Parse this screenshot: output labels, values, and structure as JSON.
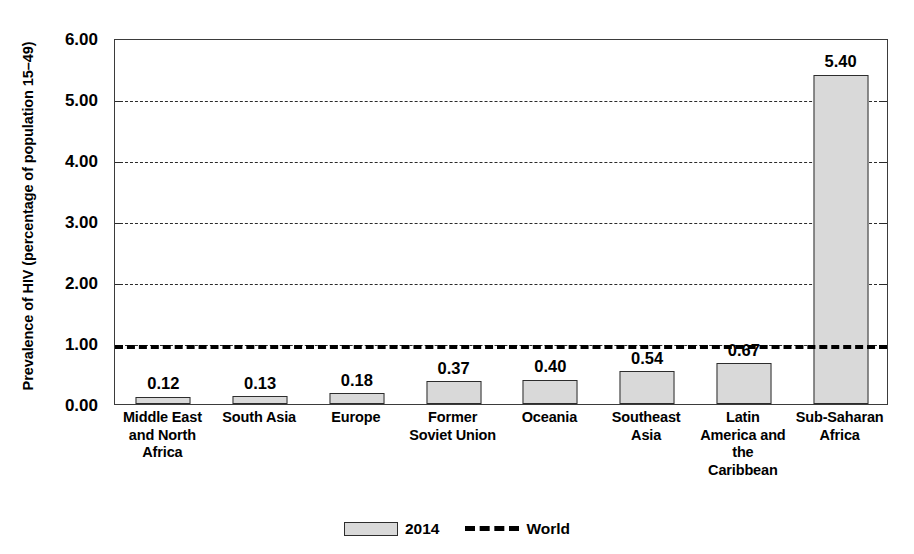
{
  "chart_data": {
    "type": "bar",
    "title": "",
    "subtitle": "",
    "xlabel": "",
    "ylabel": "Prevalence of HIV (percentage of population 15–49)",
    "ylim": [
      0,
      6
    ],
    "ytick_labels": [
      "0.00",
      "1.00",
      "2.00",
      "3.00",
      "4.00",
      "5.00",
      "6.00"
    ],
    "ytick_values": [
      0,
      1,
      2,
      3,
      4,
      5,
      6
    ],
    "grid": true,
    "grid_axis": "y",
    "grid_style": "dashed",
    "legend_position": "bottom-center",
    "categories": [
      "Middle East and North Africa",
      "South Asia",
      "Europe",
      "Former Soviet Union",
      "Oceania",
      "Southeast Asia",
      "Latin America and the Caribbean",
      "Sub-Saharan Africa"
    ],
    "category_label_lines": [
      [
        "Middle East",
        "and North",
        "Africa"
      ],
      [
        "South Asia"
      ],
      [
        "Europe"
      ],
      [
        "Former",
        "Soviet Union"
      ],
      [
        "Oceania"
      ],
      [
        "Southeast",
        "Asia"
      ],
      [
        "Latin",
        "America and",
        "the",
        "Caribbean"
      ],
      [
        "Sub-Saharan",
        "Africa"
      ]
    ],
    "series": [
      {
        "name": "2014",
        "type": "bar",
        "color": "#d9d9d9",
        "edge_color": "#2d2d2d",
        "values": [
          0.12,
          0.13,
          0.18,
          0.37,
          0.4,
          0.54,
          0.67,
          5.4
        ],
        "value_labels": [
          "0.12",
          "0.13",
          "0.18",
          "0.37",
          "0.40",
          "0.54",
          "0.67",
          "5.40"
        ]
      },
      {
        "name": "World",
        "type": "line",
        "style": "dashed",
        "color": "#000000",
        "value": 1.0
      }
    ]
  },
  "legend": {
    "items": [
      {
        "label": "2014",
        "swatch": "bar-swatch"
      },
      {
        "label": "World",
        "swatch": "dashed-line-swatch"
      }
    ]
  },
  "colors": {
    "bar_fill": "#d9d9d9",
    "bar_edge": "#2d2d2d",
    "axis": "#3b3b3b",
    "grid": "#2b2b2b",
    "world_line": "#000000",
    "text": "#000000",
    "background": "#ffffff"
  }
}
